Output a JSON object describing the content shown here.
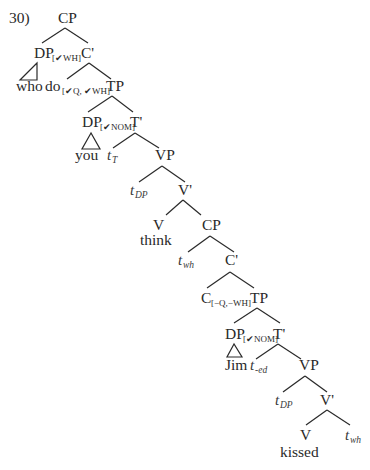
{
  "example_number": "30)",
  "tree": {
    "root_cp": "CP",
    "spec_cp_dp": {
      "label": "DP",
      "features": "[✔WH]"
    },
    "c_bar": "C'",
    "who": "who",
    "do": {
      "label": "do",
      "features": "[✔Q, ✔WH]"
    },
    "tp": "TP",
    "spec_tp_dp": {
      "label": "DP",
      "features": "[✔NOM]"
    },
    "t_bar": "T'",
    "you": "you",
    "t_T": {
      "label": "t",
      "sub": "T"
    },
    "vp": "VP",
    "t_DP": {
      "label": "t",
      "sub": "DP"
    },
    "v_bar": "V'",
    "v": "V",
    "think": "think",
    "embedded_cp": "CP",
    "t_wh": {
      "label": "t",
      "sub": "wh"
    },
    "embedded_c_bar": "C'",
    "embedded_c": {
      "label": "C",
      "features": "[−Q,−WH]"
    },
    "embedded_tp": "TP",
    "embedded_spec_dp": {
      "label": "DP",
      "features": "[✔NOM]"
    },
    "embedded_t_bar": "T'",
    "jim": "Jim",
    "t_ed": {
      "label": "t",
      "sub": "-ed"
    },
    "embedded_vp": "VP",
    "embedded_t_DP": {
      "label": "t",
      "sub": "DP"
    },
    "embedded_v_bar": "V'",
    "embedded_v": "V",
    "kissed": "kissed",
    "embedded_t_wh": {
      "label": "t",
      "sub": "wh"
    }
  }
}
